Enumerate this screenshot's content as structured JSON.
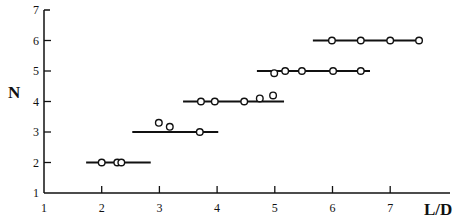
{
  "chart_data": {
    "type": "scatter",
    "title": "",
    "xlabel": "L/D",
    "ylabel": "N",
    "xlim": [
      1,
      8.05
    ],
    "ylim": [
      1,
      7
    ],
    "xticks": [
      1,
      2,
      3,
      4,
      5,
      6,
      7
    ],
    "yticks": [
      1,
      2,
      3,
      4,
      5,
      6,
      7
    ],
    "grid": false,
    "legend": null,
    "levels": [
      {
        "N": 2,
        "line_range": [
          1.73,
          2.85
        ],
        "points": [
          [
            2.0,
            2.0
          ],
          [
            2.27,
            2.0
          ],
          [
            2.34,
            2.0
          ]
        ]
      },
      {
        "N": 3,
        "line_range": [
          2.53,
          4.02
        ],
        "points": [
          [
            2.99,
            3.3
          ],
          [
            3.18,
            3.17
          ],
          [
            3.7,
            3.0
          ]
        ]
      },
      {
        "N": 4,
        "line_range": [
          3.41,
          5.16
        ],
        "points": [
          [
            3.72,
            4.0
          ],
          [
            3.96,
            4.0
          ],
          [
            4.47,
            4.0
          ],
          [
            4.74,
            4.1
          ],
          [
            4.97,
            4.2
          ]
        ]
      },
      {
        "N": 5,
        "line_range": [
          4.69,
          6.65
        ],
        "points": [
          [
            4.99,
            4.93
          ],
          [
            5.18,
            5.0
          ],
          [
            5.47,
            5.0
          ],
          [
            6.01,
            5.0
          ],
          [
            6.49,
            5.0
          ]
        ]
      },
      {
        "N": 6,
        "line_range": [
          5.66,
          7.53
        ],
        "points": [
          [
            5.99,
            6.0
          ],
          [
            6.49,
            6.0
          ],
          [
            7.0,
            6.0
          ],
          [
            7.5,
            6.0
          ]
        ]
      }
    ]
  },
  "labels": {
    "x_axis_title": "L/D",
    "y_axis_title": "N",
    "x_ticks": [
      "1",
      "2",
      "3",
      "4",
      "5",
      "6",
      "7"
    ],
    "y_ticks": [
      "1",
      "2",
      "3",
      "4",
      "5",
      "6",
      "7"
    ]
  }
}
